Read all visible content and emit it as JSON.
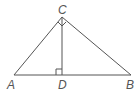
{
  "diagram": {
    "type": "right-triangle-with-altitude",
    "points": {
      "A": {
        "label": "A",
        "x": 14,
        "y": 75
      },
      "B": {
        "label": "B",
        "x": 131,
        "y": 75
      },
      "C": {
        "label": "C",
        "x": 62,
        "y": 17
      },
      "D": {
        "label": "D",
        "x": 62,
        "y": 75
      }
    },
    "segments": [
      "AB",
      "AC",
      "BC",
      "CD"
    ],
    "right_angles": [
      "D",
      "C"
    ],
    "colors": {
      "stroke": "#555555",
      "label": "#555555",
      "background": "#ffffff"
    }
  }
}
